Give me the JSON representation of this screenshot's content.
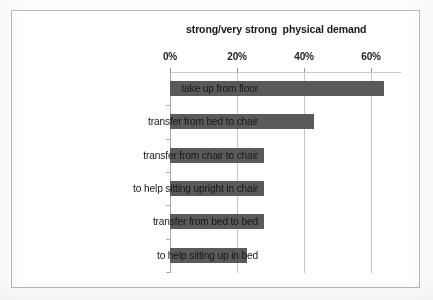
{
  "chart_data": {
    "type": "bar",
    "orientation": "horizontal",
    "title": "strong/very strong  physical demand",
    "xlabel": "",
    "ylabel": "",
    "grid": true,
    "legend": "none",
    "xlim": [
      0,
      70
    ],
    "xticks": [
      {
        "label": "0%",
        "value": 0
      },
      {
        "label": "20%",
        "value": 20
      },
      {
        "label": "40%",
        "value": 40
      },
      {
        "label": "60%",
        "value": 60
      }
    ],
    "categories": [
      "take up from floor",
      "transfer from bed to chair",
      "transfer from chair to chair",
      "to help sitting upright in chair",
      "transfer from bed to bed",
      "to help sitting up in bed"
    ],
    "values": [
      64,
      43,
      28,
      28,
      28,
      23
    ],
    "series": [
      {
        "name": "strong/very strong physical demand",
        "values": [
          64,
          43,
          28,
          28,
          28,
          23
        ]
      }
    ],
    "bar_color": "#5a5a5a",
    "background_color": "#ffffff",
    "border_color": "#b9b9b9",
    "gridline_color": "#c4c4c4"
  }
}
